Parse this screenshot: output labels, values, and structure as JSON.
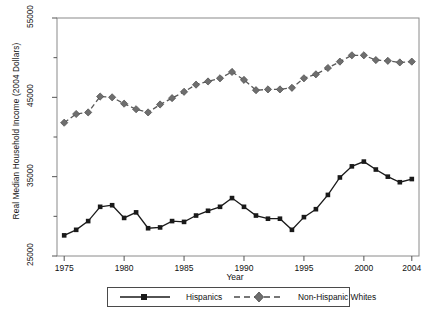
{
  "chart_data": {
    "type": "line",
    "title": "",
    "xlabel": "Year",
    "ylabel": "Real Median Household Income (2004 Dollars)",
    "xlim": [
      1974.4,
      2004.6
    ],
    "ylim": [
      25000,
      55000
    ],
    "xticks": [
      1975,
      1980,
      1985,
      1990,
      1995,
      2000,
      2004
    ],
    "xtick_labels": [
      "1975",
      "1980",
      "1985",
      "1990",
      "1995",
      "2000",
      "2004"
    ],
    "yticks": [
      25000,
      30000,
      35000,
      40000,
      45000,
      50000,
      55000
    ],
    "ytick_labels": [
      "25000",
      "",
      "35000",
      "",
      "45000",
      "",
      "55000"
    ],
    "ytick_major_labels": [
      "25000",
      "35000",
      "45000",
      "55000"
    ],
    "grid": false,
    "legend_position": "below",
    "x": [
      1975,
      1976,
      1977,
      1978,
      1979,
      1980,
      1981,
      1982,
      1983,
      1984,
      1985,
      1986,
      1987,
      1988,
      1989,
      1990,
      1991,
      1992,
      1993,
      1994,
      1995,
      1996,
      1997,
      1998,
      1999,
      2000,
      2001,
      2002,
      2003,
      2004
    ],
    "series": [
      {
        "name": "Hispanics",
        "marker": "square",
        "linestyle": "solid",
        "color": "#1a1a1a",
        "values": [
          27600,
          28300,
          29400,
          31200,
          31400,
          29800,
          30500,
          28500,
          28600,
          29400,
          29300,
          30100,
          30700,
          31200,
          32300,
          31200,
          30100,
          29700,
          29700,
          28300,
          29900,
          30900,
          32700,
          34900,
          36300,
          36900,
          35900,
          35000,
          34300,
          34700
        ]
      },
      {
        "name": "Non-Hispanic Whites",
        "marker": "diamond",
        "linestyle": "dashed",
        "color": "#6e6e6e",
        "values": [
          41800,
          42900,
          43100,
          45100,
          45000,
          44200,
          43500,
          43100,
          44100,
          44900,
          45700,
          46600,
          47000,
          47400,
          48200,
          47200,
          45900,
          46000,
          46000,
          46200,
          47400,
          47900,
          48700,
          49500,
          50300,
          50300,
          49700,
          49600,
          49400,
          49500
        ]
      }
    ]
  },
  "axis": {
    "ylabel": "Real Median Household Income (2004 Dollars)",
    "xlabel": "Year"
  },
  "legend": {
    "entries": [
      {
        "label": "Hispanics"
      },
      {
        "label": "Non-Hispanic Whites"
      }
    ]
  }
}
